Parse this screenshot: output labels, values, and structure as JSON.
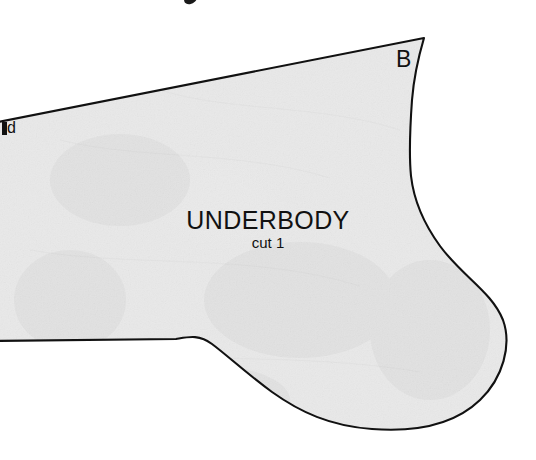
{
  "document": {
    "type": "sewing-pattern-scan",
    "background_color": "#ffffff",
    "paper_fill_color": "#e9e9e9",
    "ink_color": "#111111"
  },
  "piece": {
    "name": "UNDERBODY",
    "cut_instruction": "cut 1",
    "corner_label": "B",
    "edge_label_partial": "d"
  },
  "shape": {
    "description": "Large pattern piece occupying most of the frame, clipped at the left image edge. A long straight top edge rises from the left edge to a sharp peak at the upper right, then the right side curves inward to a narrow waist before flaring into a large rounded lobe at the bottom right. The bottom edge runs nearly horizontally from the left, then sweeps down and right into the lobe.",
    "path": "M -12 124 L 424 38 C 419 55 414 75 412 100 C 410 128 409 156 411 176 C 414 202 424 224 440 246 C 462 276 492 292 503 320 C 512 345 503 378 480 400 C 452 427 412 432 372 429 C 330 426 300 412 272 392 C 246 373 228 356 212 344 C 199 334 188 337 176 339 L -12 341 Z",
    "peak_point": [
      424,
      38
    ],
    "waist_point": [
      410,
      176
    ],
    "right_extent": [
      505,
      322
    ],
    "bottom_extent": [
      390,
      429
    ],
    "left_clip_top": [
      0,
      118
    ],
    "left_clip_bottom": [
      0,
      341
    ]
  }
}
